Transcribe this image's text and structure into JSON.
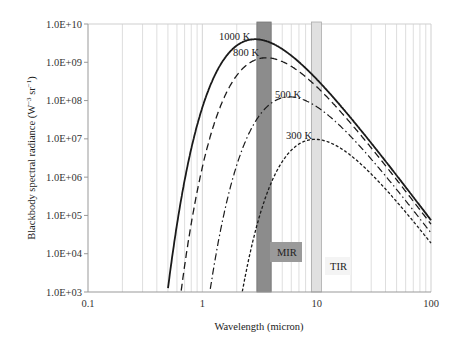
{
  "chart_data": {
    "type": "line",
    "title": "",
    "xlabel": "Wavelength (micron)",
    "ylabel": "Blackbody spectral radiance (W⁻³ sr⁻¹)",
    "xscale": "log",
    "yscale": "log",
    "xlim": [
      0.1,
      100
    ],
    "ylim": [
      1000,
      10000000000
    ],
    "x_ticks": [
      "0.1",
      "1",
      "10",
      "100"
    ],
    "y_ticks": [
      "1.0E+03",
      "1.0E+04",
      "1.0E+05",
      "1.0E+06",
      "1.0E+07",
      "1.0E+08",
      "1.0E+09",
      "1.0E+10"
    ],
    "grid": "vertical minor log grid",
    "series": [
      {
        "name": "1000 K",
        "temperature": 1000,
        "style": "solid",
        "peak_wavelength": 2.9,
        "peak_value": 4000000000
      },
      {
        "name": "800 K",
        "temperature": 800,
        "style": "dashed",
        "peak_wavelength": 3.6,
        "peak_value": 1300000000
      },
      {
        "name": "500 K",
        "temperature": 500,
        "style": "dash-dot",
        "peak_wavelength": 5.8,
        "peak_value": 130000000
      },
      {
        "name": "300 K",
        "temperature": 300,
        "style": "dotted",
        "peak_wavelength": 9.7,
        "peak_value": 10000000
      }
    ],
    "bands": [
      {
        "name": "MIR",
        "range": [
          3,
          4
        ],
        "color": "#8c8c8c"
      },
      {
        "name": "TIR",
        "range": [
          9,
          11
        ],
        "color": "#e0e0e0"
      }
    ]
  },
  "labels": {
    "xlabel": "Wavelength (micron)",
    "ylabel_main": "Blackbody spectral radiance (W",
    "ylabel_sup1": "−3",
    "ylabel_mid": " sr",
    "ylabel_sup2": "−1",
    "ylabel_end": ")",
    "mir": "MIR",
    "tir": "TIR",
    "c1000": "1000 K",
    "c800": "800 K",
    "c500": "500 K",
    "c300": "300 K"
  }
}
